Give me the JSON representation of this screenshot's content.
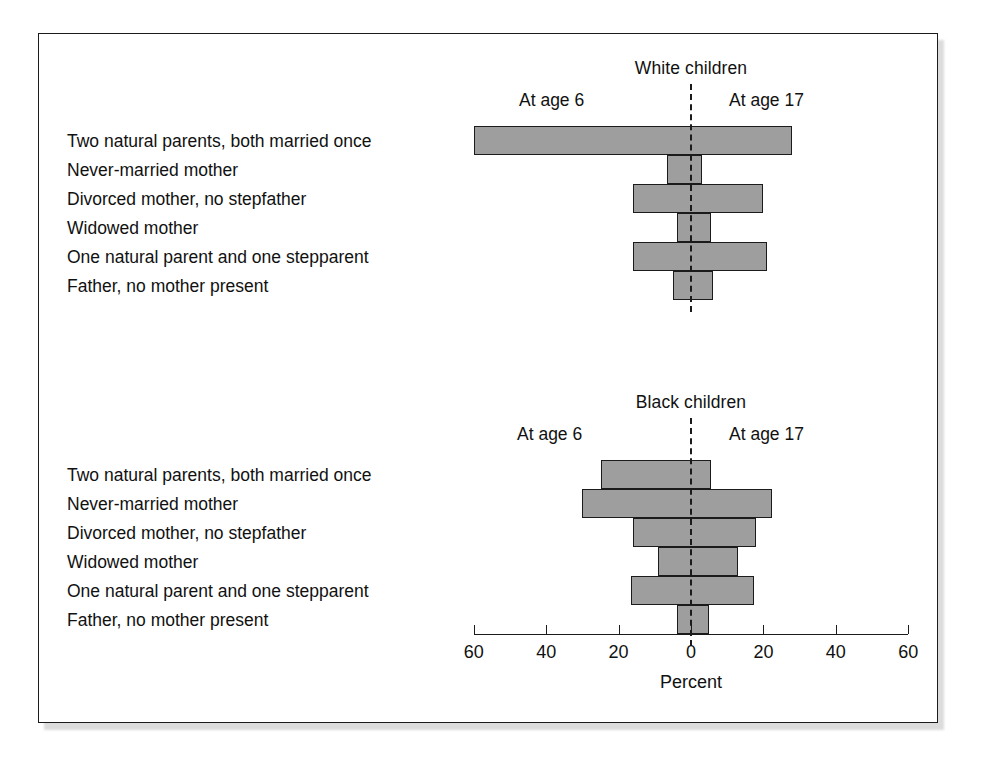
{
  "figure": {
    "background_color": "#ffffff",
    "frame_color": "#1b1b1b",
    "bar_fill_color": "#9e9e9e",
    "bar_border_color": "#1b1b1b"
  },
  "chart_data": {
    "type": "bar",
    "title": "",
    "xlabel": "Percent",
    "ylabel": "",
    "xlim": [
      -60,
      60
    ],
    "grid": false,
    "legend_position": "above-panel",
    "orientation": "horizontal-diverging",
    "categories": [
      "Two natural parents, both married once",
      "Never-married mother",
      "Divorced mother, no stepfather",
      "Widowed mother",
      "One natural parent and one stepparent",
      "Father, no mother present"
    ],
    "axis_ticks": [
      {
        "label": "60",
        "value": -60
      },
      {
        "label": "40",
        "value": -40
      },
      {
        "label": "20",
        "value": -20
      },
      {
        "label": "0",
        "value": 0
      },
      {
        "label": "20",
        "value": 20
      },
      {
        "label": "40",
        "value": 40
      },
      {
        "label": "60",
        "value": 60
      }
    ],
    "panels": [
      {
        "id": "white",
        "title": "White children",
        "left_series_label": "At age 6",
        "right_series_label": "At age 17",
        "series": [
          {
            "name": "At age 6",
            "side": "left",
            "values": [
              60,
              6.5,
              16,
              4,
              16,
              5
            ]
          },
          {
            "name": "At age 17",
            "side": "right",
            "values": [
              28,
              3,
              20,
              5.5,
              21,
              6
            ]
          }
        ]
      },
      {
        "id": "black",
        "title": "Black children",
        "left_series_label": "At age 6",
        "right_series_label": "At age 17",
        "series": [
          {
            "name": "At age 6",
            "side": "left",
            "values": [
              25,
              30,
              16,
              9,
              16.5,
              4
            ]
          },
          {
            "name": "At age 17",
            "side": "right",
            "values": [
              5.5,
              22.5,
              18,
              13,
              17.5,
              5
            ]
          }
        ]
      }
    ]
  }
}
